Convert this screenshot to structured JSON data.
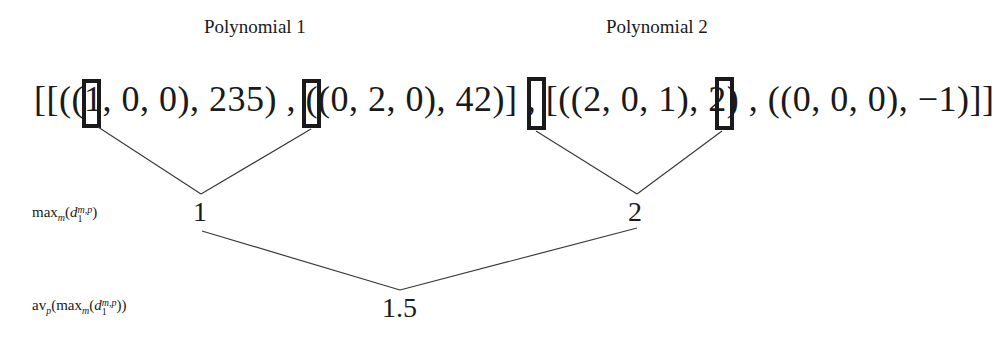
{
  "titles": {
    "polynomial_1": "Polynomial 1",
    "polynomial_2": "Polynomial 2"
  },
  "expression": {
    "text": "[[((1, 0, 0), 235) , ((0, 2, 0), 42)] , [((2, 0, 1), 2) , ((0, 0, 0), −1)]]",
    "polynomials": [
      {
        "name": "Polynomial 1",
        "monomials": [
          {
            "exponents": [
              1,
              0,
              0
            ],
            "coefficient": 235,
            "highlighted_exponent": 1
          },
          {
            "exponents": [
              0,
              2,
              0
            ],
            "coefficient": 42,
            "highlighted_exponent": 0
          }
        ]
      },
      {
        "name": "Polynomial 2",
        "monomials": [
          {
            "exponents": [
              2,
              0,
              1
            ],
            "coefficient": 2,
            "highlighted_exponent": 2
          },
          {
            "exponents": [
              0,
              0,
              0
            ],
            "coefficient": -1,
            "highlighted_exponent": 0
          }
        ]
      }
    ]
  },
  "row_labels": {
    "max_label_main": "max",
    "max_label_sub": "m",
    "max_label_d": "d",
    "max_label_d_sub": "1",
    "max_label_d_sup": "m,p",
    "avg_label_main": "av",
    "avg_label_sub": "p"
  },
  "nodes": {
    "max_poly1": "1",
    "max_poly2": "2",
    "average": "1.5"
  }
}
